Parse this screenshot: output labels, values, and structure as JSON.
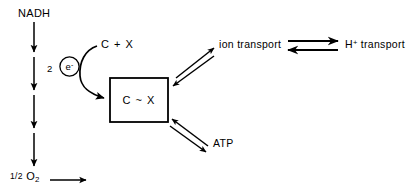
{
  "diagram": {
    "stroke_color": "#000000",
    "background_color": "#ffffff",
    "nodes": {
      "nadh": "NADH",
      "half_oxygen": "1/2 O",
      "half_oxygen_fraction": "1/2",
      "half_oxygen_symbol": "O",
      "half_oxygen_subscript": "2",
      "electron_count": "2",
      "electron_symbol": "e",
      "electron_charge": "-",
      "substrate_free": "C + X",
      "substrate_bound": "C ~ X",
      "ion_transport": "ion transport",
      "proton_transport_symbol": "H",
      "proton_transport_charge": "+",
      "proton_transport_label": "transport",
      "atp": "ATP"
    },
    "edges": [
      {
        "name": "nadh-chain-1",
        "from": "NADH",
        "to": "carrier 1",
        "style": "single-arrow-down"
      },
      {
        "name": "nadh-chain-2",
        "from": "carrier 1",
        "to": "carrier 2",
        "style": "single-arrow-down"
      },
      {
        "name": "nadh-chain-3",
        "from": "carrier 2",
        "to": "carrier 3",
        "style": "single-arrow-down"
      },
      {
        "name": "nadh-chain-4",
        "from": "carrier 3",
        "to": "1/2 O2",
        "style": "single-arrow-down"
      },
      {
        "name": "oxygen-outlet",
        "from": "1/2 O2",
        "to": "water",
        "style": "single-arrow-right"
      },
      {
        "name": "electron-to-complex",
        "from": "C + X",
        "to": "C ~ X",
        "style": "curved-arrow"
      },
      {
        "name": "complex-ion-transport",
        "from": "C ~ X",
        "to": "ion transport",
        "style": "double-arrow"
      },
      {
        "name": "complex-atp",
        "from": "C ~ X",
        "to": "ATP",
        "style": "double-arrow"
      },
      {
        "name": "ion-proton-equilibrium",
        "from": "ion transport",
        "to": "H+ transport",
        "style": "equilibrium"
      }
    ]
  }
}
